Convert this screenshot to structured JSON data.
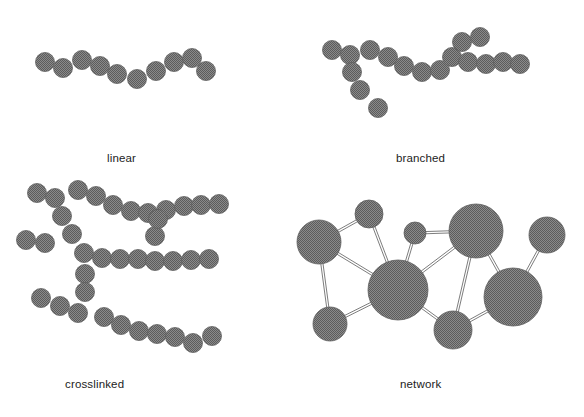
{
  "figure": {
    "background_color": "#ffffff",
    "monomer_fill": "#7d7d7d",
    "monomer_stroke": "#5e5e5e",
    "bond_color": "#6e6e6e",
    "label_color": "#1c1c1c"
  },
  "panels": [
    {
      "id": "linear",
      "label": "linear",
      "label_x": 107,
      "label_y": 152,
      "description": "A single unbranched chain of monomer beads",
      "monomer_radius": 9.5,
      "bead_count": 11,
      "beads": [
        {
          "cx": 45,
          "cy": 62
        },
        {
          "cx": 63,
          "cy": 68
        },
        {
          "cx": 82,
          "cy": 60
        },
        {
          "cx": 100,
          "cy": 66
        },
        {
          "cx": 117,
          "cy": 74
        },
        {
          "cx": 137,
          "cy": 79
        },
        {
          "cx": 156,
          "cy": 71
        },
        {
          "cx": 174,
          "cy": 62
        },
        {
          "cx": 192,
          "cy": 58
        },
        {
          "cx": 206,
          "cy": 71
        }
      ]
    },
    {
      "id": "branched",
      "label": "branched",
      "label_x": 396,
      "label_y": 152,
      "description": "A main chain with side branches extending from it",
      "monomer_radius": 9.5,
      "bead_count": 17,
      "beads": [
        {
          "cx": 332,
          "cy": 50
        },
        {
          "cx": 350,
          "cy": 55
        },
        {
          "cx": 370,
          "cy": 50
        },
        {
          "cx": 388,
          "cy": 57
        },
        {
          "cx": 404,
          "cy": 66
        },
        {
          "cx": 422,
          "cy": 72
        },
        {
          "cx": 440,
          "cy": 70
        },
        {
          "cx": 452,
          "cy": 57
        },
        {
          "cx": 462,
          "cy": 42
        },
        {
          "cx": 480,
          "cy": 37
        },
        {
          "cx": 468,
          "cy": 62
        },
        {
          "cx": 486,
          "cy": 64
        },
        {
          "cx": 503,
          "cy": 62
        },
        {
          "cx": 520,
          "cy": 64
        },
        {
          "cx": 352,
          "cy": 72
        },
        {
          "cx": 360,
          "cy": 90
        },
        {
          "cx": 378,
          "cy": 108
        }
      ]
    },
    {
      "id": "crosslinked",
      "label": "crosslinked",
      "label_x": 65,
      "label_y": 378,
      "description": "Several chains joined to one another by crosslinking bridges",
      "monomer_radius": 9.5,
      "bead_count": 34,
      "beads": [
        {
          "cx": 37,
          "cy": 193
        },
        {
          "cx": 55,
          "cy": 198
        },
        {
          "cx": 78,
          "cy": 190
        },
        {
          "cx": 96,
          "cy": 196
        },
        {
          "cx": 113,
          "cy": 205
        },
        {
          "cx": 131,
          "cy": 211
        },
        {
          "cx": 148,
          "cy": 213
        },
        {
          "cx": 166,
          "cy": 210
        },
        {
          "cx": 184,
          "cy": 206
        },
        {
          "cx": 201,
          "cy": 205
        },
        {
          "cx": 219,
          "cy": 204
        },
        {
          "cx": 62,
          "cy": 216
        },
        {
          "cx": 72,
          "cy": 234
        },
        {
          "cx": 26,
          "cy": 240
        },
        {
          "cx": 45,
          "cy": 243
        },
        {
          "cx": 84,
          "cy": 253
        },
        {
          "cx": 102,
          "cy": 258
        },
        {
          "cx": 120,
          "cy": 259
        },
        {
          "cx": 138,
          "cy": 259
        },
        {
          "cx": 155,
          "cy": 261
        },
        {
          "cx": 155,
          "cy": 236
        },
        {
          "cx": 158,
          "cy": 219
        },
        {
          "cx": 173,
          "cy": 261
        },
        {
          "cx": 191,
          "cy": 260
        },
        {
          "cx": 209,
          "cy": 259
        },
        {
          "cx": 85,
          "cy": 274
        },
        {
          "cx": 85,
          "cy": 292
        },
        {
          "cx": 41,
          "cy": 298
        },
        {
          "cx": 60,
          "cy": 306
        },
        {
          "cx": 78,
          "cy": 313
        },
        {
          "cx": 104,
          "cy": 317
        },
        {
          "cx": 121,
          "cy": 325
        },
        {
          "cx": 139,
          "cy": 331
        },
        {
          "cx": 157,
          "cy": 334
        },
        {
          "cx": 175,
          "cy": 337
        },
        {
          "cx": 193,
          "cy": 343
        },
        {
          "cx": 212,
          "cy": 336
        }
      ]
    },
    {
      "id": "network",
      "label": "network",
      "label_x": 400,
      "label_y": 378,
      "description": "Junction points joined by bonds into a three-dimensional network",
      "nodes": [
        {
          "id": "n1",
          "cx": 369,
          "cy": 214,
          "r": 14
        },
        {
          "id": "n2",
          "cx": 319,
          "cy": 242,
          "r": 22
        },
        {
          "id": "n3",
          "cx": 415,
          "cy": 233,
          "r": 11
        },
        {
          "id": "n4",
          "cx": 476,
          "cy": 231,
          "r": 27
        },
        {
          "id": "n5",
          "cx": 547,
          "cy": 235,
          "r": 18
        },
        {
          "id": "n6",
          "cx": 398,
          "cy": 290,
          "r": 30
        },
        {
          "id": "n7",
          "cx": 513,
          "cy": 297,
          "r": 29
        },
        {
          "id": "n8",
          "cx": 330,
          "cy": 324,
          "r": 17
        },
        {
          "id": "n9",
          "cx": 453,
          "cy": 330,
          "r": 19
        }
      ],
      "edges": [
        {
          "from": "n1",
          "to": "n2"
        },
        {
          "from": "n1",
          "to": "n6"
        },
        {
          "from": "n2",
          "to": "n8"
        },
        {
          "from": "n2",
          "to": "n6"
        },
        {
          "from": "n3",
          "to": "n4"
        },
        {
          "from": "n3",
          "to": "n6"
        },
        {
          "from": "n4",
          "to": "n6"
        },
        {
          "from": "n4",
          "to": "n9"
        },
        {
          "from": "n4",
          "to": "n7"
        },
        {
          "from": "n5",
          "to": "n7"
        },
        {
          "from": "n6",
          "to": "n8"
        },
        {
          "from": "n6",
          "to": "n9"
        },
        {
          "from": "n7",
          "to": "n9"
        }
      ],
      "node_count": 9,
      "edge_count": 13
    }
  ]
}
